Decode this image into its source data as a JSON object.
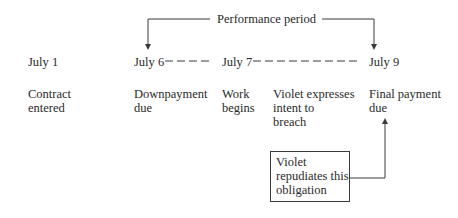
{
  "performance_period": {
    "label": "Performance period"
  },
  "timeline": [
    {
      "date": "July 1",
      "event": [
        "Contract",
        "entered"
      ]
    },
    {
      "date": "July 6",
      "event": [
        "Downpayment",
        "due"
      ]
    },
    {
      "date": "July 7",
      "event": [
        "Work",
        "begins"
      ]
    },
    {
      "date": "",
      "event": [
        "Violet expresses",
        "intent to",
        "breach"
      ]
    },
    {
      "date": "July 9",
      "event": [
        "Final payment",
        "due"
      ]
    }
  ],
  "callout": {
    "lines": [
      "Violet",
      "repudiates this",
      "obligation"
    ]
  },
  "colors": {
    "line": "#3a3a3a",
    "text": "#2a2a2a"
  }
}
